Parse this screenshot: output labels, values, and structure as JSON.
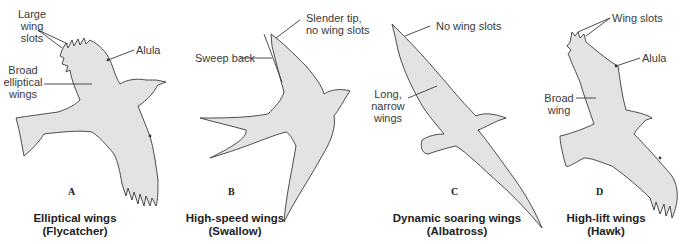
{
  "panels": [
    {
      "letter": "A",
      "caption": "Elliptical wings",
      "subcaption": "(Flycatcher)",
      "labels": {
        "slots": [
          "Large",
          "wing",
          "slots"
        ],
        "alula": "Alula",
        "wing": [
          "Broad",
          "elliptical",
          "wings"
        ]
      }
    },
    {
      "letter": "B",
      "caption": "High-speed wings",
      "subcaption": "(Swallow)",
      "labels": {
        "tip": [
          "Slender tip,",
          "no wing slots"
        ],
        "sweep": "Sweep back"
      }
    },
    {
      "letter": "C",
      "caption": "Dynamic soaring wings",
      "subcaption": "(Albatross)",
      "labels": {
        "slots": "No wing slots",
        "wing": [
          "Long,",
          "narrow",
          "wings"
        ]
      }
    },
    {
      "letter": "D",
      "caption": "High-lift wings",
      "subcaption": "(Hawk)",
      "labels": {
        "slots": "Wing slots",
        "alula": "Alula",
        "wing": [
          "Broad",
          "wing"
        ]
      }
    }
  ],
  "colors": {
    "bird_fill": "#e3e3e3",
    "outline": "#3a3a3a"
  }
}
